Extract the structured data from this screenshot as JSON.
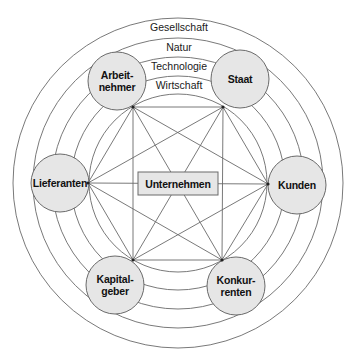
{
  "diagram": {
    "center": {
      "x": 178,
      "y": 183
    },
    "rings": [
      {
        "r": 165,
        "label": "Gesellschaft",
        "label_y": 31
      },
      {
        "r": 145,
        "label": "Natur",
        "label_y": 51
      },
      {
        "r": 126,
        "label": "Technologie",
        "label_y": 70
      },
      {
        "r": 107,
        "label": "Wirtschaft",
        "label_y": 89
      },
      {
        "r": 89,
        "label": ""
      }
    ],
    "core": {
      "label": "Unternehmen",
      "x": 138,
      "y": 172,
      "w": 80,
      "h": 23
    },
    "nodes": [
      {
        "id": "arbeitnehmer",
        "lines": [
          "Arbeit-",
          "nehmer"
        ],
        "cx": 117,
        "cy": 81,
        "r": 29,
        "vx": 133,
        "vy": 107
      },
      {
        "id": "staat",
        "lines": [
          "Staat"
        ],
        "cx": 240,
        "cy": 79,
        "r": 29,
        "vx": 223,
        "vy": 107
      },
      {
        "id": "lieferanten",
        "lines": [
          "Lieferanten"
        ],
        "cx": 60,
        "cy": 183,
        "r": 29,
        "vx": 88,
        "vy": 183
      },
      {
        "id": "kunden",
        "lines": [
          "Kunden"
        ],
        "cx": 297,
        "cy": 185,
        "r": 29,
        "vx": 268,
        "vy": 184
      },
      {
        "id": "kapitalgeber",
        "lines": [
          "Kapital-",
          "geber"
        ],
        "cx": 115,
        "cy": 285,
        "r": 29,
        "vx": 133,
        "vy": 260
      },
      {
        "id": "konkurrenten",
        "lines": [
          "Konkur-",
          "renten"
        ],
        "cx": 236,
        "cy": 286,
        "r": 29,
        "vx": 222,
        "vy": 260
      }
    ],
    "colors": {
      "line": "#6a6a6a",
      "node_fill": "#e6e6e6",
      "text": "#111111"
    }
  }
}
